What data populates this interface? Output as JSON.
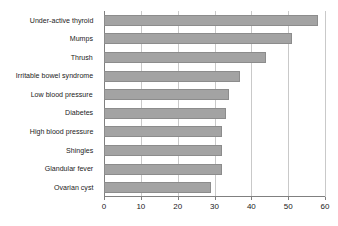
{
  "chart_data": {
    "type": "bar",
    "orientation": "horizontal",
    "title": "",
    "subtitle": "",
    "xlabel": "",
    "ylabel": "",
    "xlim": [
      0,
      60
    ],
    "xticks": [
      0,
      10,
      20,
      30,
      40,
      50,
      60
    ],
    "xtick_labels": [
      "0",
      "10",
      "20",
      "30",
      "40",
      "50",
      "60"
    ],
    "grid": "vertical",
    "legend": "none",
    "categories": [
      "Under-active thyroid",
      "Mumps",
      "Thrush",
      "Irritable bowel syndrome",
      "Low blood pressure",
      "Diabetes",
      "High blood pressure",
      "Shingles",
      "Glandular fever",
      "Ovarian cyst"
    ],
    "values": [
      58,
      51,
      44,
      37,
      34,
      33,
      32,
      32,
      32,
      29
    ],
    "colors": {
      "bar_fill": "#a3a3a3",
      "bar_outline": "#8c8c8c",
      "gridline": "#c9c9c9",
      "axis": "#808080",
      "text": "#1a1a1a",
      "background": "#ffffff"
    }
  }
}
